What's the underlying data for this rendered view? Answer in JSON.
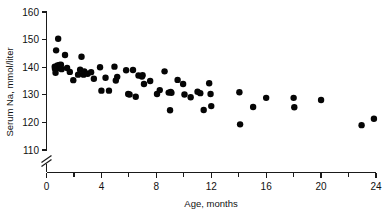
{
  "chart_data": {
    "type": "scatter",
    "title": "",
    "xlabel": "Age, months",
    "ylabel": "Serum Na, mmol/liter",
    "xlim": [
      0,
      24
    ],
    "ylim": [
      110,
      160
    ],
    "y_axis_break": true,
    "y_axis_break_note": "axis broken below 110",
    "grid": false,
    "legend": "none",
    "marker": {
      "shape": "circle",
      "filled": true,
      "color": "#050505",
      "size_px": 4.4
    },
    "x_ticks_major": [
      0,
      4,
      8,
      12,
      16,
      20,
      24
    ],
    "x_ticks_minor": [
      2,
      6,
      10,
      14,
      18,
      22
    ],
    "y_ticks_major": [
      110,
      120,
      130,
      140,
      150,
      160
    ],
    "x_ticklabels": [
      "0",
      "4",
      "8",
      "12",
      "16",
      "20",
      "24"
    ],
    "y_ticklabels": [
      "110",
      "120",
      "130",
      "140",
      "150",
      "160"
    ],
    "n_points": 76,
    "series_name": "Serum sodium by age",
    "points": [
      [
        0.85,
        150.3
      ],
      [
        0.7,
        146.1
      ],
      [
        0.6,
        140.2
      ],
      [
        0.62,
        139.4
      ],
      [
        0.66,
        138.0
      ],
      [
        0.78,
        139.6
      ],
      [
        0.8,
        140.6
      ],
      [
        0.95,
        140.8
      ],
      [
        1.0,
        140.0
      ],
      [
        1.05,
        140.9
      ],
      [
        1.1,
        139.3
      ],
      [
        1.35,
        144.4
      ],
      [
        1.5,
        139.7
      ],
      [
        1.7,
        138.3
      ],
      [
        1.95,
        135.3
      ],
      [
        2.3,
        137.3
      ],
      [
        2.45,
        139.1
      ],
      [
        2.55,
        143.8
      ],
      [
        2.7,
        137.3
      ],
      [
        2.75,
        138.5
      ],
      [
        3.0,
        137.6
      ],
      [
        3.25,
        138.2
      ],
      [
        3.45,
        135.8
      ],
      [
        3.9,
        140.0
      ],
      [
        4.0,
        131.5
      ],
      [
        4.3,
        136.2
      ],
      [
        4.55,
        131.5
      ],
      [
        4.95,
        140.2
      ],
      [
        5.05,
        135.2
      ],
      [
        5.15,
        136.5
      ],
      [
        5.8,
        138.9
      ],
      [
        5.95,
        130.3
      ],
      [
        6.05,
        130.1
      ],
      [
        6.3,
        139.0
      ],
      [
        6.5,
        129.3
      ],
      [
        6.7,
        137.0
      ],
      [
        6.95,
        136.6
      ],
      [
        7.0,
        137.1
      ],
      [
        7.1,
        133.9
      ],
      [
        7.55,
        135.0
      ],
      [
        8.05,
        130.3
      ],
      [
        8.25,
        131.7
      ],
      [
        8.6,
        138.5
      ],
      [
        8.9,
        130.8
      ],
      [
        9.05,
        131.0
      ],
      [
        9.1,
        130.7
      ],
      [
        9.0,
        124.4
      ],
      [
        9.55,
        135.4
      ],
      [
        9.95,
        133.9
      ],
      [
        10.05,
        130.1
      ],
      [
        10.5,
        129.1
      ],
      [
        11.0,
        131.1
      ],
      [
        11.2,
        130.6
      ],
      [
        11.45,
        124.5
      ],
      [
        11.85,
        134.2
      ],
      [
        11.95,
        130.3
      ],
      [
        12.0,
        125.9
      ],
      [
        14.05,
        130.9
      ],
      [
        14.1,
        119.3
      ],
      [
        15.05,
        125.6
      ],
      [
        16.0,
        128.9
      ],
      [
        18.0,
        128.9
      ],
      [
        18.05,
        125.5
      ],
      [
        20.0,
        128.1
      ],
      [
        22.95,
        119.0
      ],
      [
        23.85,
        121.3
      ]
    ]
  },
  "axes": {
    "x_title": "Age, months",
    "y_title": "Serum Na, mmol/liter"
  }
}
